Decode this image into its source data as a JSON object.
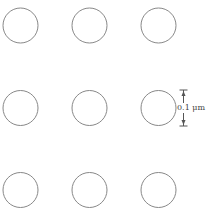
{
  "diagram": {
    "type": "circle-lattice",
    "rows": 3,
    "cols": 3,
    "stroke_color": "#888888",
    "circles": [
      {
        "cx": 20.5,
        "cy": 25.5,
        "r": 17.5
      },
      {
        "cx": 89.5,
        "cy": 25.5,
        "r": 17.5
      },
      {
        "cx": 158.5,
        "cy": 25.5,
        "r": 17.5
      },
      {
        "cx": 20.5,
        "cy": 108,
        "r": 17.5
      },
      {
        "cx": 89.5,
        "cy": 108,
        "r": 17.5
      },
      {
        "cx": 158.5,
        "cy": 108,
        "r": 17.5
      },
      {
        "cx": 20.5,
        "cy": 190,
        "r": 17.5
      },
      {
        "cx": 89.5,
        "cy": 190,
        "r": 17.5
      },
      {
        "cx": 158.5,
        "cy": 190,
        "r": 17.5
      }
    ],
    "dimension": {
      "label": "0.1 μm",
      "x": 183.5,
      "y_top": 90,
      "y_bottom": 126
    }
  }
}
